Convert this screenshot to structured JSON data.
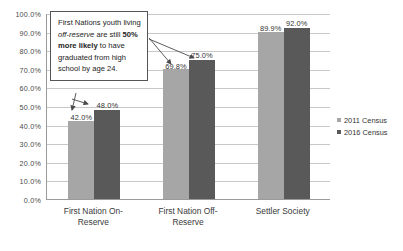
{
  "chart_data": {
    "type": "bar",
    "title": "",
    "xlabel": "",
    "ylabel": "",
    "ylim": [
      0,
      100
    ],
    "grid": true,
    "legend_position": "right",
    "categories": [
      "First Nation On-\nReserve",
      "First Nation Off-\nReserve",
      "Settler Society"
    ],
    "series": [
      {
        "name": "2011 Census",
        "color": "#a6a6a6",
        "values": [
          42.0,
          69.8,
          89.9
        ],
        "labels": [
          "42.0%",
          "69.8%",
          "89.9%"
        ]
      },
      {
        "name": "2016 Census",
        "color": "#595959",
        "values": [
          48.0,
          75.0,
          92.0
        ],
        "labels": [
          "48.0%",
          "75.0%",
          "92.0%"
        ]
      }
    ],
    "ytick_labels": [
      "100.0%",
      "90.0%",
      "80.0%",
      "70.0%",
      "60.0%",
      "50.0%",
      "40.0%",
      "30.0%",
      "20.0%",
      "10.0%",
      "0.0%"
    ],
    "ytick_values": [
      100,
      90,
      80,
      70,
      60,
      50,
      40,
      30,
      20,
      10,
      0
    ]
  },
  "annotation": {
    "line1": "First Nations youth",
    "line2_prefix": "living ",
    "line2_italic": "off-reserve",
    "line2_suffix": " are",
    "line3_prefix": "still ",
    "line3_bold": "50% more likely",
    "line4": "to have graduated",
    "line5": "from high school by",
    "line6": "age 24.",
    "full_text": "First Nations youth living off-reserve are still 50% more likely to have graduated from high school by age 24."
  },
  "legend": {
    "items": [
      {
        "label": "2011 Census",
        "color": "#a6a6a6"
      },
      {
        "label": "2016 Census",
        "color": "#595959"
      }
    ]
  }
}
